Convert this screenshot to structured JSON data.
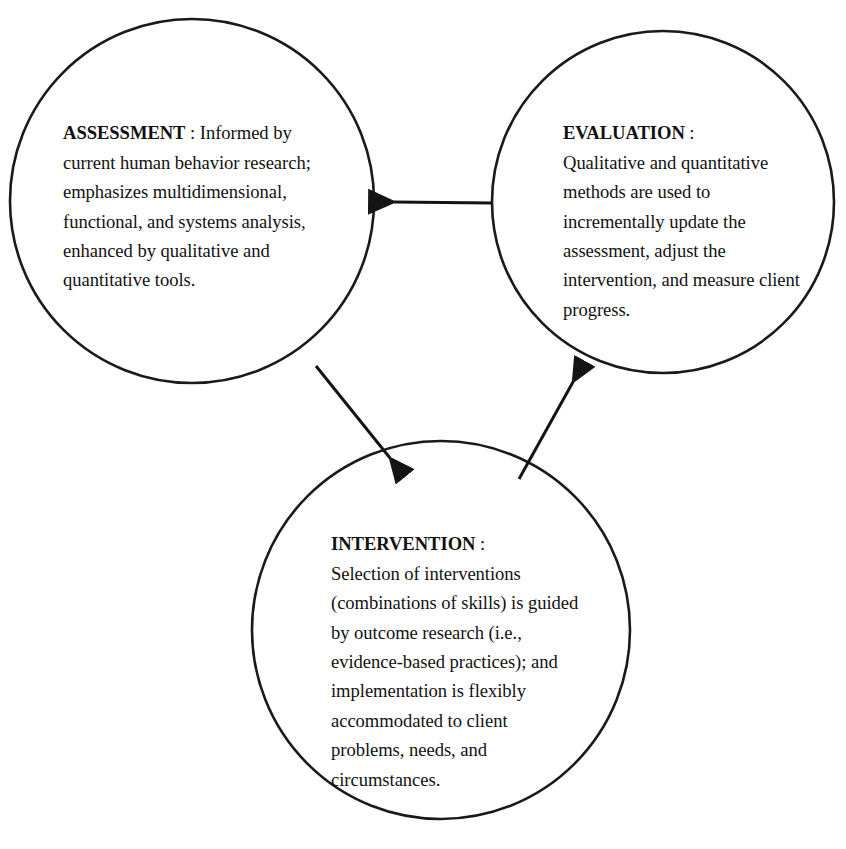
{
  "diagram": {
    "type": "cycle-diagram",
    "shape": "three-circle-loop",
    "background_color": "#ffffff",
    "stroke_color": "#1a1a1a",
    "text_color": "#121212",
    "nodes": [
      {
        "id": "assessment",
        "title": "ASSESSMENT",
        "separator": " : ",
        "body": "Informed by current human behavior research; emphasizes multidimensional, functional, and systems analysis, enhanced by qualitative and quantitative tools.",
        "full_text": "ASSESSMENT : Informed by current human behavior research; emphasizes multidimensional, functional, and systems analysis, enhanced by qualitative and quantitative tools.",
        "lines": [
          "ASSESSMENT : Informed",
          "by current human behavior",
          "research; emphasizes",
          "multidimensional,",
          "functional, and systems",
          "analysis, enhanced by",
          "qualitative and quantitative",
          "tools."
        ],
        "center": {
          "x": 192,
          "y": 201
        },
        "radius": 182
      },
      {
        "id": "evaluation",
        "title": "EVALUATION",
        "separator": " :",
        "body": "Qualitative and quantitative methods are used to incrementally update the assessment, adjust the intervention, and measure client progress.",
        "full_text": "EVALUATION : Qualitative and quantitative methods are used to incrementally update the assessment, adjust the intervention, and measure client progress.",
        "lines": [
          "EVALUATION :",
          "Qualitative and",
          "quantitative methods are",
          "used to incrementally",
          "update the assessment,",
          "adjust the intervention,",
          "and measure client",
          "progress."
        ],
        "center": {
          "x": 663,
          "y": 202
        },
        "radius": 171
      },
      {
        "id": "intervention",
        "title": "INTERVENTION",
        "separator": " :",
        "body": "Selection of interventions (combinations of skills) is guided by outcome research (i.e., evidence-based practices); and implementation is flexibly accommodated to client problems, needs, and circumstances.",
        "full_text": "INTERVENTION : Selection of interventions (combinations of skills) is guided by outcome research (i.e., evidence-based practices); and implementation is flexibly accommodated to client problems, needs, and circumstances.",
        "lines": [
          "INTERVENTION :",
          "Selection of interventions",
          "(combinations of skills)",
          "is guided by outcome",
          "research (i.e., evidence-",
          "based practices); and",
          "implementation is flexibly",
          "accommodated to client",
          "problems, needs, and",
          "circumstances."
        ],
        "center": {
          "x": 441,
          "y": 630
        },
        "radius": 189
      }
    ],
    "arrows": [
      {
        "id": "evaluation-to-assessment",
        "from": "evaluation",
        "to": "assessment",
        "direction": "left",
        "start": {
          "x": 492,
          "y": 203
        },
        "end": {
          "x": 379,
          "y": 202
        }
      },
      {
        "id": "assessment-to-intervention",
        "from": "assessment",
        "to": "intervention",
        "direction": "down-right",
        "start": {
          "x": 316,
          "y": 366
        },
        "end": {
          "x": 399,
          "y": 469
        }
      },
      {
        "id": "intervention-to-evaluation",
        "from": "intervention",
        "to": "evaluation",
        "direction": "up-right",
        "start": {
          "x": 519,
          "y": 479
        },
        "end": {
          "x": 580,
          "y": 370
        }
      }
    ]
  }
}
